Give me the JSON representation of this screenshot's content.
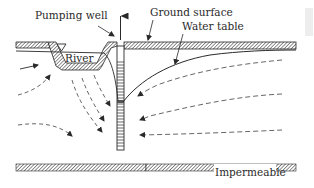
{
  "diagram": {
    "labels": {
      "pumping_well": "Pumping well",
      "ground_surface": "Ground surface",
      "water_table": "Water table",
      "river": "River",
      "impermeable": "Impermeable"
    },
    "symbols": {
      "water_level": "water-level-triangle-icon"
    },
    "colors": {
      "line": "#2a2a2a",
      "hatch": "#444444",
      "dash": "#555555",
      "background": "#ffffff"
    }
  }
}
